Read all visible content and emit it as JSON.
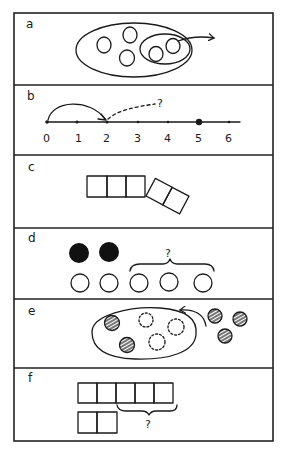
{
  "figure": {
    "panels": [
      {
        "id": "a",
        "label": "a",
        "description": "Large oval containing five circles; a smaller inner oval surrounds two circles with an arrow pointing out"
      },
      {
        "id": "b",
        "label": "b",
        "description": "Number line 0-6 with a solid arc jump from 0 to 2 and a dashed arrow with question mark; point 5 highlighted"
      },
      {
        "id": "c",
        "label": "c",
        "description": "Row of three squares joined to a tilted pair of two squares"
      },
      {
        "id": "d",
        "label": "d",
        "description": "Two filled circles above five open circles; brace over last three open circles with question mark"
      },
      {
        "id": "e",
        "label": "e",
        "description": "Oval with two striped circles and three dashed circles; three striped circles outside with arrow toward oval"
      },
      {
        "id": "f",
        "label": "f",
        "description": "Row of five squares above row of two squares; brace under last three top squares with question mark"
      }
    ],
    "number_line": {
      "ticks": [
        "0",
        "1",
        "2",
        "3",
        "4",
        "5",
        "6"
      ],
      "highlighted": "5",
      "question_mark": "?"
    },
    "question_marks": {
      "b": "?",
      "d": "?",
      "f": "?"
    },
    "colors": {
      "ink": "#1a1a1a",
      "background": "#ffffff"
    }
  }
}
